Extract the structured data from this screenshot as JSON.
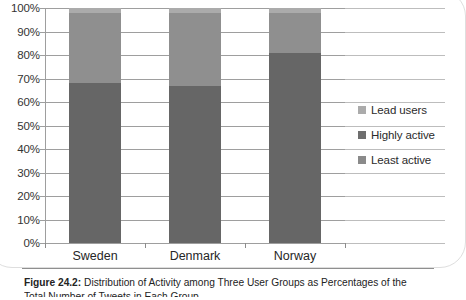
{
  "chart_data": {
    "type": "bar",
    "subtype": "stacked-percentage",
    "title": "",
    "xlabel": "",
    "ylabel": "",
    "ylim": [
      0,
      100
    ],
    "grid": true,
    "legend_position": "right",
    "categories": [
      "Sweden",
      "Denmark",
      "Norway"
    ],
    "ytick_labels": [
      "0%",
      "10%",
      "20%",
      "30%",
      "40%",
      "50%",
      "60%",
      "70%",
      "80%",
      "90%",
      "100%"
    ],
    "ytick_values": [
      0,
      10,
      20,
      30,
      40,
      50,
      60,
      70,
      80,
      90,
      100
    ],
    "series": [
      {
        "name": "Least active",
        "color": "#666666",
        "values": [
          68,
          67,
          81
        ]
      },
      {
        "name": "Highly active",
        "color": "#8f8f8f",
        "values": [
          30,
          31,
          17
        ]
      },
      {
        "name": "Lead users",
        "color": "#ababab",
        "values": [
          2,
          2,
          2
        ]
      }
    ]
  },
  "legend": {
    "items": [
      {
        "label": "Lead users",
        "color": "#ababab"
      },
      {
        "label": "Highly active",
        "color": "#6e6e6e"
      },
      {
        "label": "Least active",
        "color": "#8a8a8a"
      }
    ]
  },
  "caption": {
    "label": "Figure 24.2:",
    "line1": " Distribution of Activity among Three User Groups as Percentages of the",
    "line2": "Total Number of Tweets in Each Group"
  }
}
